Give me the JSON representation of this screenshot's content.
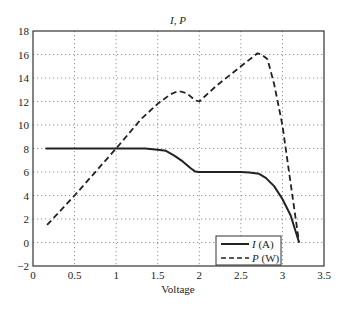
{
  "chart_data": {
    "type": "line",
    "title": "I, P",
    "xlabel": "Voltage",
    "ylabel": "",
    "xlim": [
      0,
      3.5
    ],
    "ylim": [
      -2,
      18
    ],
    "xticks": [
      0,
      0.5,
      1,
      1.5,
      2,
      2.5,
      3,
      3.5
    ],
    "xtick_labels": [
      "0",
      "0.5",
      "1",
      "1.5",
      "2",
      "2.5",
      "3",
      "3.5"
    ],
    "yticks": [
      -2,
      0,
      2,
      4,
      6,
      8,
      10,
      12,
      14,
      16,
      18
    ],
    "ytick_labels": [
      "−2",
      "0",
      "2",
      "4",
      "6",
      "8",
      "10",
      "12",
      "14",
      "16",
      "18"
    ],
    "grid": true,
    "legend_position": "lower right",
    "series": [
      {
        "name": "I (A)",
        "style": "solid",
        "x": [
          0.15,
          0.5,
          1.0,
          1.35,
          1.5,
          1.6,
          1.7,
          1.8,
          1.9,
          1.95,
          2.0,
          2.3,
          2.5,
          2.6,
          2.72,
          2.8,
          2.9,
          3.0,
          3.1,
          3.2
        ],
        "y": [
          8,
          8,
          8,
          8,
          7.9,
          7.8,
          7.4,
          6.9,
          6.3,
          6.05,
          6.0,
          6.0,
          6.0,
          5.95,
          5.85,
          5.5,
          4.8,
          3.7,
          2.3,
          0
        ]
      },
      {
        "name": "P (W)",
        "style": "dashed",
        "x": [
          0.17,
          0.5,
          1.0,
          1.3,
          1.5,
          1.65,
          1.75,
          1.85,
          1.95,
          2.0,
          2.2,
          2.5,
          2.7,
          2.75,
          2.82,
          2.9,
          3.0,
          3.1,
          3.2
        ],
        "y": [
          1.5,
          4.0,
          8.0,
          10.5,
          11.8,
          12.6,
          12.9,
          12.7,
          12.1,
          12.0,
          13.3,
          15.0,
          16.1,
          16.0,
          15.6,
          13.5,
          10.0,
          5.0,
          0
        ]
      }
    ]
  },
  "legend": {
    "items": [
      {
        "label_var": "I",
        "label_unit": " (A)"
      },
      {
        "label_var": "P",
        "label_unit": " (W)"
      }
    ]
  }
}
